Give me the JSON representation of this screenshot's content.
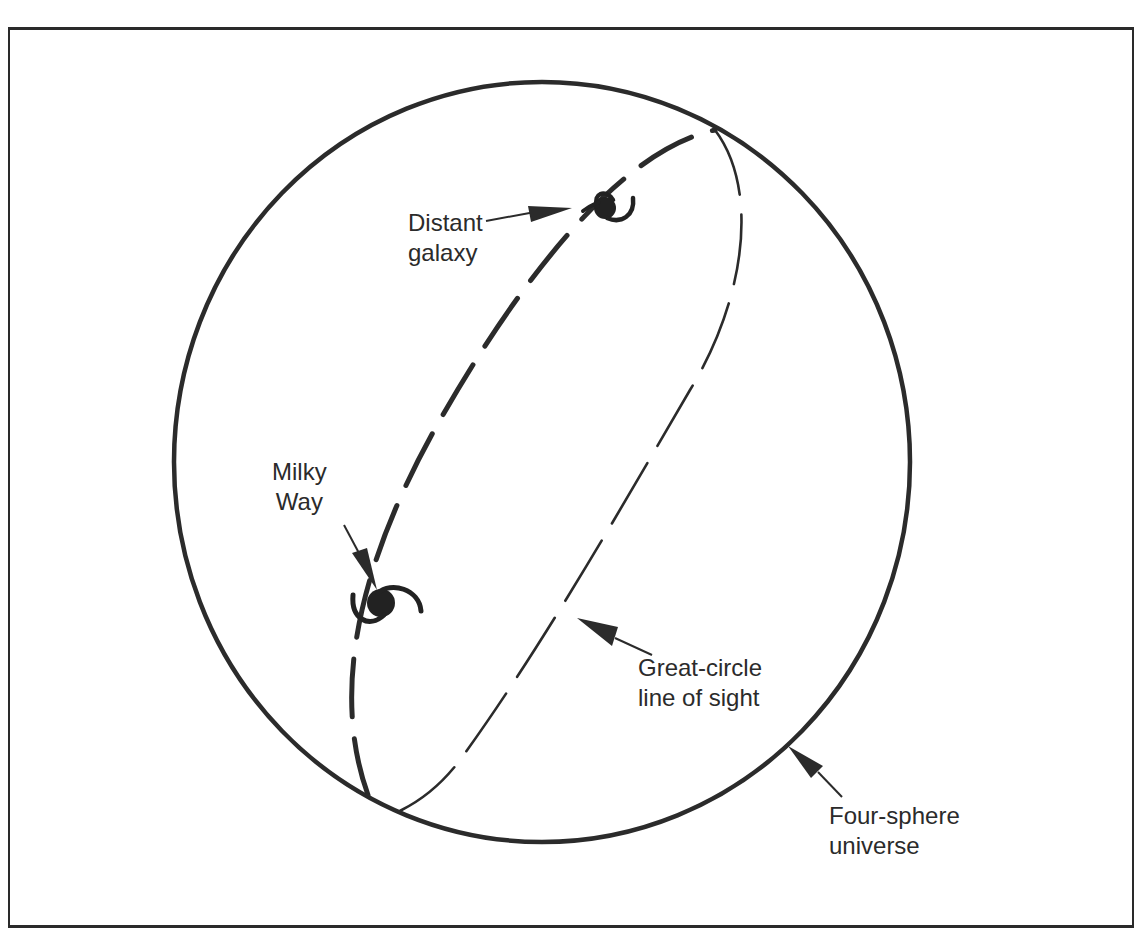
{
  "diagram": {
    "type": "concept illustration",
    "colors": {
      "ink": "#2b2b2b",
      "background": "#ffffff"
    },
    "labels": {
      "distant_galaxy": {
        "line1": "Distant",
        "line2": "galaxy"
      },
      "milky_way": {
        "line1": "Milky",
        "line2": "Way"
      },
      "great_circle": {
        "line1": "Great-circle",
        "line2": "line of sight"
      },
      "four_sphere": {
        "line1": "Four-sphere",
        "line2": "universe"
      }
    },
    "elements": [
      {
        "name": "four-sphere-circle",
        "style": "solid thick outline"
      },
      {
        "name": "great-circle-near-half",
        "style": "thick long dashes"
      },
      {
        "name": "great-circle-far-half",
        "style": "thin dashes"
      },
      {
        "name": "milky-way-galaxy-icon",
        "style": "spiral galaxy glyph"
      },
      {
        "name": "distant-galaxy-icon",
        "style": "spiral galaxy glyph"
      }
    ]
  }
}
